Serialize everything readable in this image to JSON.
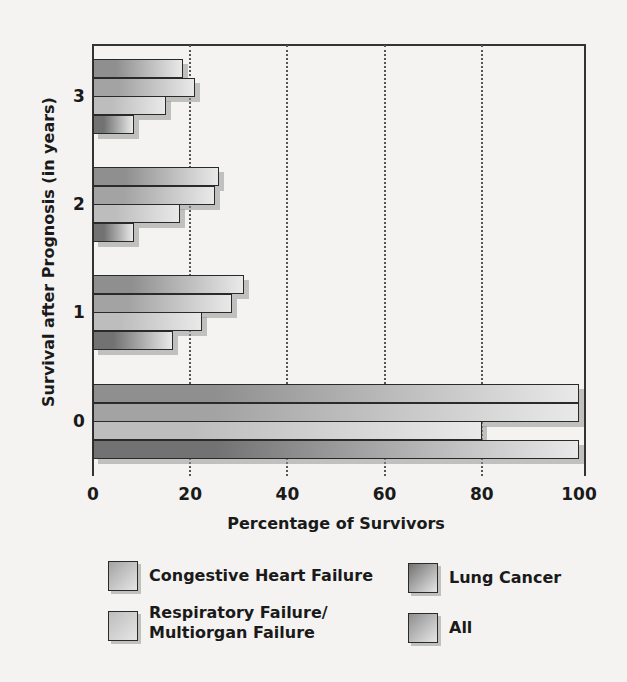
{
  "chart_data": {
    "type": "bar",
    "orientation": "horizontal",
    "title": "",
    "xlabel": "Percentage of Survivors",
    "ylabel": "Survival after Prognosis (in years)",
    "xlim": [
      0,
      100
    ],
    "xticks": [
      "0",
      "20",
      "40",
      "60",
      "80",
      "100"
    ],
    "categories": [
      "0",
      "1",
      "2",
      "3"
    ],
    "grid": "vertical dotted at 20, 40, 60, 80",
    "series": [
      {
        "name": "All",
        "color": "#8f8f8f",
        "values": [
          100,
          31,
          26,
          18.5
        ]
      },
      {
        "name": "Congestive Heart Failure",
        "color": "#a3a3a3",
        "values": [
          100,
          28.5,
          25,
          21
        ]
      },
      {
        "name": "Respiratory Failure/ Multiorgan Failure",
        "color": "#bdbdbd",
        "values": [
          80,
          22.5,
          18,
          15
        ]
      },
      {
        "name": "Lung Cancer",
        "color": "#727272",
        "values": [
          100,
          16.5,
          8.5,
          8.5
        ]
      }
    ],
    "legend": {
      "position": "bottom",
      "entries": [
        {
          "label": "Congestive Heart Failure",
          "color": "#a3a3a3"
        },
        {
          "label": "Lung Cancer",
          "color": "#727272"
        },
        {
          "label": "Respiratory Failure/\nMultiorgan Failure",
          "color": "#bdbdbd"
        },
        {
          "label": "All",
          "color": "#8f8f8f"
        }
      ]
    }
  }
}
